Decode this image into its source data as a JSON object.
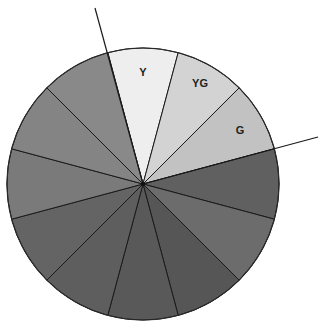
{
  "diagram": {
    "type": "color-wheel-sectors",
    "center": [
      143,
      184
    ],
    "radius": 136,
    "sector_count": 12,
    "start_angle_deg": -105,
    "sectors": [
      {
        "label": "Y",
        "color": "#eeeeee",
        "label_pos": [
          143,
          72
        ]
      },
      {
        "label": "YG",
        "color": "#d3d3d3",
        "label_pos": [
          200,
          83
        ]
      },
      {
        "label": "G",
        "color": "#c2c2c2",
        "label_pos": [
          240,
          130
        ]
      },
      {
        "label": "",
        "color": "#606060"
      },
      {
        "label": "",
        "color": "#6c6c6c"
      },
      {
        "label": "",
        "color": "#565656"
      },
      {
        "label": "",
        "color": "#595959"
      },
      {
        "label": "",
        "color": "#5e5e5e"
      },
      {
        "label": "",
        "color": "#646464"
      },
      {
        "label": "",
        "color": "#7a7a7a"
      },
      {
        "label": "",
        "color": "#848484"
      },
      {
        "label": "",
        "color": "#898989"
      }
    ],
    "extension_lines": [
      {
        "from": [
          95,
          8
        ],
        "to": [
          143,
          184
        ]
      },
      {
        "from": [
          143,
          184
        ],
        "to": [
          318,
          137
        ]
      }
    ]
  }
}
